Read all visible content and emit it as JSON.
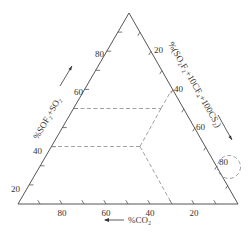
{
  "diagram": {
    "type": "ternary",
    "axes": {
      "left": {
        "title": "%SOF₂+SO₂",
        "ticks": [
          "20",
          "40",
          "60",
          "80"
        ]
      },
      "right": {
        "title": "%(SO₂F₂+10CF₄+100CS₂)",
        "ticks": [
          "20",
          "40",
          "60",
          "80"
        ]
      },
      "bottom": {
        "title": "%CO₂",
        "ticks": [
          "80",
          "60",
          "40",
          "20"
        ]
      }
    },
    "colors": {
      "axis": "#555555",
      "dashed": "#888888",
      "text": "#333333"
    }
  }
}
